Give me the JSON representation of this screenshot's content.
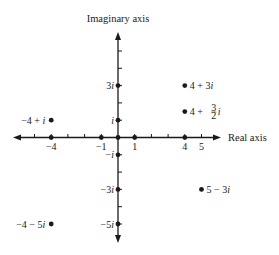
{
  "chart_data": {
    "type": "scatter",
    "title": "",
    "xlabel": "Real axis",
    "ylabel": "Imaginary axis",
    "xlim": [
      -6,
      6
    ],
    "ylim": [
      -6,
      6
    ],
    "grid": false,
    "x_ticks": [
      -5,
      -4,
      -3,
      -2,
      -1,
      0,
      1,
      2,
      3,
      4,
      5
    ],
    "x_tick_labels": [
      {
        "value": -4,
        "label": "−4"
      },
      {
        "value": -1,
        "label": "−1"
      },
      {
        "value": 1,
        "label": "1"
      },
      {
        "value": 4,
        "label": "4"
      },
      {
        "value": 5,
        "label": "5"
      }
    ],
    "y_ticks": [
      -5,
      -4,
      -3,
      -2,
      -1,
      0,
      1,
      2,
      3,
      4,
      5
    ],
    "y_tick_labels": [
      {
        "value": 3,
        "label": "3i"
      },
      {
        "value": 1,
        "label": "i"
      },
      {
        "value": -1,
        "label": "−i"
      },
      {
        "value": -3,
        "label": "−3i"
      },
      {
        "value": -5,
        "label": "−5i"
      }
    ],
    "axis_points": [
      {
        "re": -4,
        "im": 0
      },
      {
        "re": -1,
        "im": 0
      },
      {
        "re": 0,
        "im": 0
      },
      {
        "re": 1,
        "im": 0
      },
      {
        "re": 4,
        "im": 0
      },
      {
        "re": 0,
        "im": 3
      },
      {
        "re": 0,
        "im": 1
      },
      {
        "re": 0,
        "im": -1
      },
      {
        "re": 0,
        "im": -3
      },
      {
        "re": 0,
        "im": -5
      }
    ],
    "points": [
      {
        "re": 4,
        "im": 3,
        "label": "4 + 3i",
        "label_side": "right"
      },
      {
        "re": 4,
        "im": 1.5,
        "label": "4 + ³⁄₂ i",
        "label_side": "right",
        "frac": {
          "pre": "4 + ",
          "num": "3",
          "den": "2",
          "post": "i"
        }
      },
      {
        "re": -4,
        "im": 1,
        "label": "−4 + i",
        "label_side": "left"
      },
      {
        "re": 5,
        "im": -3,
        "label": "5 − 3i",
        "label_side": "right"
      },
      {
        "re": -4,
        "im": -5,
        "label": "−4 − 5i",
        "label_side": "left"
      }
    ]
  },
  "layout": {
    "origin_x": 118,
    "origin_y": 137.5,
    "unit_x": 16.7,
    "unit_y": 17.3,
    "x_axis_left": 13,
    "x_axis_right": 221,
    "y_axis_top": 32,
    "y_axis_bottom": 243,
    "ink": "#1a1a1a"
  }
}
